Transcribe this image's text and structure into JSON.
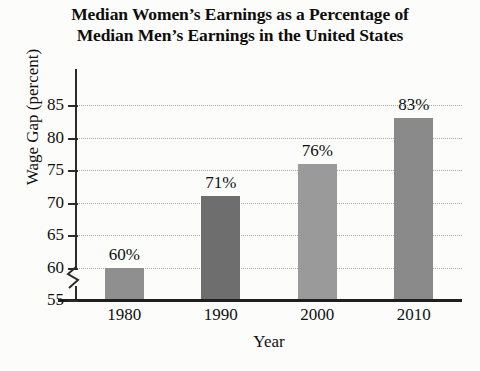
{
  "chart_data": {
    "type": "bar",
    "title": "Median Women’s Earnings as a Percentage of Median Men’s Earnings in the United States",
    "title_lines": [
      "Median Women’s Earnings as a Percentage of",
      "Median Men’s Earnings in the United States"
    ],
    "xlabel": "Year",
    "ylabel": "Wage Gap (percent)",
    "categories": [
      "1980",
      "1990",
      "2000",
      "2010"
    ],
    "values": [
      60,
      71,
      76,
      83
    ],
    "data_labels": [
      "60%",
      "71%",
      "76%",
      "83%"
    ],
    "bar_colors": [
      "#8f8f8f",
      "#6e6e6e",
      "#9a9a9a",
      "#8a8a8a"
    ],
    "ylim": [
      55,
      85
    ],
    "yticks": [
      55,
      60,
      65,
      70,
      75,
      80,
      85
    ],
    "ytick_labels": [
      "55",
      "60",
      "65",
      "70",
      "75",
      "80",
      "85"
    ],
    "grid": true,
    "grid_style": "dotted",
    "y_axis_break": true,
    "legend": null,
    "legend_position": "none"
  }
}
